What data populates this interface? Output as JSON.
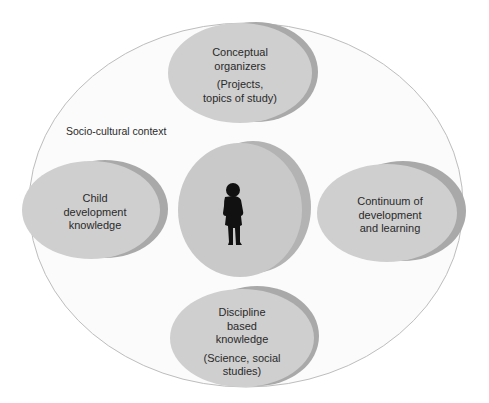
{
  "diagram": {
    "context_label": "Socio-cultural context",
    "center": {
      "icon": "child-silhouette-icon"
    },
    "nodes": [
      {
        "id": "top",
        "title": "Conceptual organizers",
        "title_lines": [
          "Conceptual",
          "organizers"
        ],
        "subtitle_lines": [
          "(Projects,",
          "topics of study)"
        ]
      },
      {
        "id": "left",
        "title": "Child development knowledge",
        "title_lines": [
          "Child",
          "development",
          "knowledge"
        ],
        "subtitle_lines": []
      },
      {
        "id": "right",
        "title": "Continuum of development and learning",
        "title_lines": [
          "Continuum of",
          "development",
          "and learning"
        ],
        "subtitle_lines": []
      },
      {
        "id": "bottom",
        "title": "Discipline based knowledge",
        "title_lines": [
          "Discipline",
          "based",
          "knowledge"
        ],
        "subtitle_lines": [
          "(Science, social",
          "studies)"
        ]
      }
    ],
    "colors": {
      "outer_fill": "#fbfbfb",
      "outer_stroke": "#bdbdbd",
      "bubble_front": "#cfcfcf",
      "bubble_back": "#a9a9a9",
      "child": "#111111"
    }
  }
}
